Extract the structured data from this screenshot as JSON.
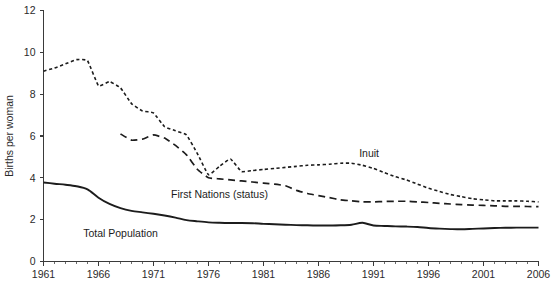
{
  "chart_data": {
    "type": "line",
    "title": "",
    "subtitle": "",
    "xlabel": "",
    "ylabel": "Births per woman",
    "xlim": [
      1961,
      2006
    ],
    "ylim": [
      0,
      12
    ],
    "y_ticks": [
      0,
      2,
      4,
      6,
      8,
      10,
      12
    ],
    "x_ticks_major": [
      1961,
      1966,
      1971,
      1976,
      1981,
      1986,
      1991,
      1996,
      2001,
      2006
    ],
    "x_tick_labels": [
      "1961",
      "1966",
      "1971",
      "1976",
      "1981",
      "1986",
      "1991",
      "1996",
      "2001",
      "2006"
    ],
    "x_minor_tick_interval": 1,
    "grid": false,
    "legend_position": "inline-annotations",
    "line_color": "#1c1c1c",
    "axis_color": "#3a3a3a",
    "background_color": "#ffffff",
    "series": [
      {
        "name": "Inuit",
        "style": "dotted",
        "label_x": 1990.6,
        "label_y": 5.0,
        "x": [
          1961,
          1962,
          1963,
          1964,
          1965,
          1966,
          1967,
          1968,
          1969,
          1970,
          1971,
          1972,
          1973,
          1974,
          1975,
          1976,
          1977,
          1978,
          1979,
          1980,
          1981,
          1982,
          1983,
          1984,
          1985,
          1986,
          1987,
          1988,
          1989,
          1990,
          1991,
          1992,
          1993,
          1994,
          1995,
          1996,
          1997,
          1998,
          1999,
          2000,
          2001,
          2002,
          2003,
          2004,
          2005,
          2006
        ],
        "values": [
          9.1,
          9.25,
          9.45,
          9.65,
          9.6,
          8.4,
          8.6,
          8.3,
          7.55,
          7.2,
          7.1,
          6.45,
          6.25,
          6.05,
          5.15,
          4.15,
          4.55,
          4.9,
          4.3,
          4.35,
          4.4,
          4.45,
          4.5,
          4.55,
          4.6,
          4.62,
          4.65,
          4.7,
          4.7,
          4.6,
          4.45,
          4.25,
          4.05,
          3.9,
          3.7,
          3.5,
          3.35,
          3.2,
          3.1,
          3.0,
          2.95,
          2.9,
          2.9,
          2.9,
          2.88,
          2.85
        ]
      },
      {
        "name": "First Nations (status)",
        "style": "dashed",
        "label_x": 1977.0,
        "label_y": 3.05,
        "x": [
          1968,
          1969,
          1970,
          1971,
          1972,
          1973,
          1974,
          1975,
          1976,
          1977,
          1978,
          1979,
          1980,
          1981,
          1982,
          1983,
          1984,
          1985,
          1986,
          1987,
          1988,
          1989,
          1990,
          1991,
          1992,
          1993,
          1994,
          1995,
          1996,
          1997,
          1998,
          1999,
          2000,
          2001,
          2002,
          2003,
          2004,
          2005,
          2006
        ],
        "values": [
          6.1,
          5.8,
          5.85,
          6.05,
          5.9,
          5.55,
          5.1,
          4.4,
          4.0,
          3.95,
          3.9,
          3.85,
          3.8,
          3.75,
          3.7,
          3.62,
          3.4,
          3.25,
          3.15,
          3.05,
          2.95,
          2.9,
          2.85,
          2.85,
          2.87,
          2.88,
          2.88,
          2.85,
          2.82,
          2.78,
          2.75,
          2.72,
          2.7,
          2.68,
          2.66,
          2.64,
          2.64,
          2.63,
          2.62
        ]
      },
      {
        "name": "Total Population",
        "style": "solid",
        "label_x": 1968.0,
        "label_y": 1.15,
        "x": [
          1961,
          1962,
          1963,
          1964,
          1965,
          1966,
          1967,
          1968,
          1969,
          1970,
          1971,
          1972,
          1973,
          1974,
          1975,
          1976,
          1977,
          1978,
          1979,
          1980,
          1981,
          1982,
          1983,
          1984,
          1985,
          1986,
          1987,
          1988,
          1989,
          1990,
          1991,
          1992,
          1993,
          1994,
          1995,
          1996,
          1997,
          1998,
          1999,
          2000,
          2001,
          2002,
          2003,
          2004,
          2005,
          2006
        ],
        "values": [
          3.78,
          3.72,
          3.67,
          3.6,
          3.45,
          3.05,
          2.75,
          2.55,
          2.42,
          2.35,
          2.28,
          2.2,
          2.1,
          1.98,
          1.92,
          1.87,
          1.85,
          1.84,
          1.84,
          1.83,
          1.8,
          1.78,
          1.76,
          1.74,
          1.73,
          1.72,
          1.72,
          1.73,
          1.76,
          1.85,
          1.72,
          1.7,
          1.68,
          1.67,
          1.65,
          1.6,
          1.57,
          1.55,
          1.54,
          1.56,
          1.58,
          1.6,
          1.61,
          1.62,
          1.62,
          1.62
        ]
      }
    ],
    "annotations": [
      {
        "text": "Inuit",
        "x": 1990.6,
        "y": 5.0
      },
      {
        "text": "First Nations (status)",
        "x": 1977.0,
        "y": 3.05
      },
      {
        "text": "Total Population",
        "x": 1968.0,
        "y": 1.15
      }
    ]
  }
}
